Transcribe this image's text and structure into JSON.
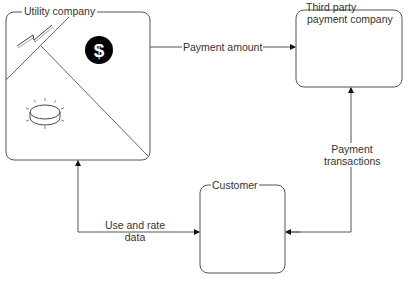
{
  "diagram": {
    "nodes": [
      {
        "id": "utility",
        "label": "Utility company",
        "icons": [
          "lightning-icon",
          "dollar-icon",
          "meter-icon"
        ]
      },
      {
        "id": "third_party",
        "label_line1": "Third party",
        "label_line2": "payment company"
      },
      {
        "id": "customer",
        "label": "Customer"
      }
    ],
    "edges": [
      {
        "from": "utility",
        "to": "third_party",
        "label": "Payment amount"
      },
      {
        "from": "customer",
        "to": "third_party",
        "label_line1": "Payment",
        "label_line2": "transactions"
      },
      {
        "from": "customer",
        "to": "utility",
        "label_line1": "Use and rate",
        "label_line2": "data"
      },
      {
        "from": "third_party",
        "to": "customer",
        "label": ""
      }
    ],
    "colors": {
      "stroke": "#555555",
      "text": "#333333",
      "icon_fill": "#000000"
    }
  }
}
